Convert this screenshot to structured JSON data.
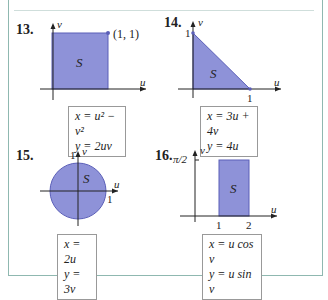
{
  "colors": {
    "region_fill": "#8e92d8",
    "region_stroke": "#5b5fb8",
    "axis": "#222222",
    "frame": "#8fb8b0"
  },
  "problems": [
    {
      "number": "13.",
      "region_label": "S",
      "axis_u": "u",
      "axis_v": "v",
      "point_label": "(1, 1)",
      "equations": [
        "x = u² − v²",
        "y = 2uv"
      ]
    },
    {
      "number": "14.",
      "region_label": "S",
      "axis_u": "u",
      "axis_v": "v",
      "tick_v": "1",
      "tick_u": "1",
      "equations": [
        "x = 3u + 4v",
        "y = 4u"
      ]
    },
    {
      "number": "15.",
      "region_label": "S",
      "axis_u": "u",
      "axis_v": "v",
      "tick_v": "1",
      "tick_u": "1",
      "equations": [
        "x = 2u",
        "y = 3v"
      ]
    },
    {
      "number": "16.",
      "region_label": "S",
      "axis_u": "u",
      "axis_v": "v",
      "tick_v": "π/2",
      "tick_u1": "1",
      "tick_u2": "2",
      "equations": [
        "x = u cos v",
        "y = u sin v"
      ]
    }
  ]
}
